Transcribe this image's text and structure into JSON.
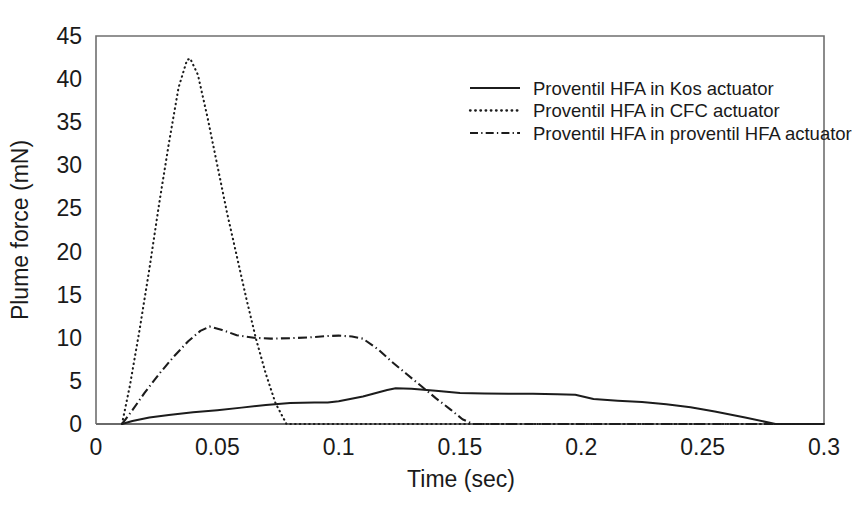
{
  "chart_data": {
    "type": "line",
    "title": "",
    "xlabel": "Time (sec)",
    "ylabel": "Plume force (mN)",
    "xlim": [
      0,
      0.3
    ],
    "ylim": [
      0,
      45
    ],
    "xticks": [
      "0",
      "0.05",
      "0.1",
      "0.15",
      "0.2",
      "0.25",
      "0.3"
    ],
    "xtick_values": [
      0,
      0.05,
      0.1,
      0.15,
      0.2,
      0.25,
      0.3
    ],
    "yticks": [
      "0",
      "5",
      "10",
      "15",
      "20",
      "25",
      "30",
      "35",
      "40",
      "45"
    ],
    "ytick_values": [
      0,
      5,
      10,
      15,
      20,
      25,
      30,
      35,
      40,
      45
    ],
    "grid": false,
    "legend_position": "upper-right",
    "series": [
      {
        "name": "Proventil HFA in Kos actuator",
        "style": "solid",
        "color": "#1c1c1c",
        "x": [
          0.0107,
          0.015,
          0.022,
          0.03,
          0.04,
          0.05,
          0.06,
          0.07,
          0.08,
          0.09,
          0.0955,
          0.1,
          0.11,
          0.12,
          0.1235,
          0.13,
          0.14,
          0.15,
          0.16,
          0.17,
          0.18,
          0.19,
          0.1975,
          0.205,
          0.215,
          0.225,
          0.235,
          0.245,
          0.255,
          0.2675,
          0.28,
          0.3
        ],
        "y": [
          0.0,
          0.35,
          0.75,
          1.05,
          1.35,
          1.6,
          1.9,
          2.2,
          2.45,
          2.5,
          2.5,
          2.65,
          3.2,
          3.95,
          4.15,
          4.1,
          3.85,
          3.6,
          3.55,
          3.5,
          3.5,
          3.45,
          3.4,
          2.9,
          2.7,
          2.55,
          2.3,
          1.95,
          1.45,
          0.75,
          0.0,
          0.0
        ]
      },
      {
        "name": "Proventil HFA in CFC actuator",
        "style": "dotted",
        "color": "#1c1c1c",
        "x": [
          0.0107,
          0.014,
          0.018,
          0.022,
          0.026,
          0.03,
          0.034,
          0.0375,
          0.0388,
          0.042,
          0.046,
          0.05,
          0.054,
          0.058,
          0.062,
          0.066,
          0.07,
          0.074,
          0.0785,
          0.3
        ],
        "y": [
          0.0,
          4.5,
          11.0,
          18.0,
          25.5,
          32.5,
          39.0,
          42.2,
          42.4,
          40.5,
          35.5,
          30.0,
          24.5,
          19.5,
          14.5,
          9.8,
          5.8,
          2.4,
          0.0,
          0.0
        ]
      },
      {
        "name": "Proventil HFA in proventil HFA actuator",
        "style": "dashdot",
        "color": "#1c1c1c",
        "x": [
          0.0107,
          0.015,
          0.02,
          0.026,
          0.032,
          0.038,
          0.043,
          0.0468,
          0.052,
          0.058,
          0.065,
          0.072,
          0.08,
          0.088,
          0.0955,
          0.1,
          0.1055,
          0.11,
          0.1165,
          0.122,
          0.128,
          0.134,
          0.14,
          0.146,
          0.151,
          0.1555,
          0.3
        ],
        "y": [
          0.0,
          1.6,
          3.6,
          5.8,
          7.8,
          9.6,
          10.8,
          11.3,
          10.9,
          10.3,
          10.0,
          9.9,
          9.95,
          10.05,
          10.2,
          10.25,
          10.15,
          9.9,
          8.6,
          7.2,
          5.8,
          4.4,
          3.0,
          1.7,
          0.55,
          0.0,
          0.0
        ]
      }
    ]
  },
  "legend": {
    "items": [
      {
        "label": "Proventil HFA in Kos actuator",
        "style": "solid"
      },
      {
        "label": "Proventil HFA in CFC actuator",
        "style": "dotted"
      },
      {
        "label": "Proventil HFA in proventil HFA actuator",
        "style": "dashdot"
      }
    ]
  }
}
